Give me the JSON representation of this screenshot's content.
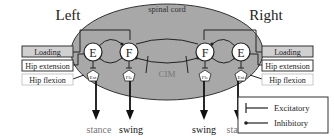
{
  "titles": {
    "left": "Left",
    "right": "Right"
  },
  "spinal_cord": {
    "label": "spinal cord",
    "fill": "#a8a8a8"
  },
  "cim_label": "CIM",
  "left": {
    "inputs": [
      {
        "label": "Loading",
        "style": "dark"
      },
      {
        "label": "Hip extension",
        "style": "dark"
      },
      {
        "label": "Hip flexion",
        "style": "light"
      }
    ],
    "neurons": [
      {
        "label": "E"
      },
      {
        "label": "F"
      }
    ],
    "motor": [
      {
        "label": "Ext"
      },
      {
        "label": "Fle"
      }
    ],
    "outputs": [
      {
        "label": "stance"
      },
      {
        "label": "swing"
      }
    ]
  },
  "right": {
    "inputs": [
      {
        "label": "Loading",
        "style": "dark"
      },
      {
        "label": "Hip extension",
        "style": "dark"
      },
      {
        "label": "Hip flexion",
        "style": "light"
      }
    ],
    "neurons": [
      {
        "label": "F"
      },
      {
        "label": "E"
      }
    ],
    "motor": [
      {
        "label": "Fle"
      },
      {
        "label": "Ext"
      }
    ],
    "outputs": [
      {
        "label": "swing"
      },
      {
        "label": "stance"
      }
    ]
  },
  "legend": {
    "items": [
      {
        "label": "Excitatory",
        "symbol": "bar-end"
      },
      {
        "label": "Inhibitory",
        "symbol": "dot-end"
      }
    ]
  },
  "colors": {
    "input_box_fill": "#d0d0d0",
    "neuron_fill": "#ffffff",
    "stroke": "#222222"
  }
}
